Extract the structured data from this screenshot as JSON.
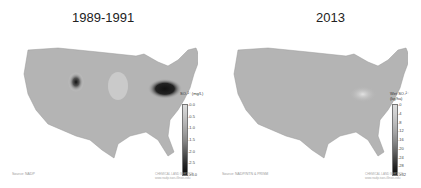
{
  "panels": [
    {
      "title": "1989-1991",
      "legend": {
        "title": "SO₄²⁻ (mg/L)",
        "ticks": [
          "0.0",
          "0.5",
          "1.0",
          "1.5",
          "2.0",
          "2.5",
          "≥3.0"
        ],
        "colors": [
          "#dcdcdc",
          "#c4c4c4",
          "#a8a8a8",
          "#8a8a8a",
          "#5a5a5a",
          "#2a2a2a",
          "#050505"
        ]
      },
      "source": "Source: NADP",
      "credit_line1": "CHEMICAL LAND SERVICE",
      "credit_line2": "www.nadp.isws.illinois.edu"
    },
    {
      "title": "2013",
      "legend": {
        "title": "Wet SO₄²⁻ (kg/ha)",
        "ticks": [
          "0",
          "4",
          "8",
          "12",
          "16",
          "20",
          "24",
          "28",
          "≥32"
        ],
        "colors": [
          "#dcdcdc",
          "#cfcfcf",
          "#bdbdbd",
          "#a8a8a8",
          "#8e8e8e",
          "#6e6e6e",
          "#4a4a4a",
          "#262626",
          "#050505"
        ]
      },
      "source": "Source: NADP/NTN & PRISM",
      "credit_line1": "CHEMICAL LAND SERVICE",
      "credit_line2": "www.nadp.isws.illinois.edu"
    }
  ]
}
